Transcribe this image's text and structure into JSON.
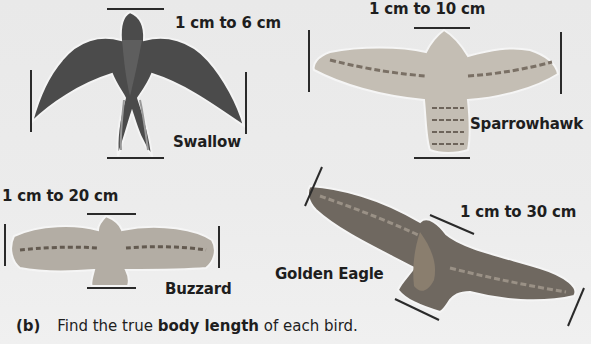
{
  "birds": [
    {
      "name": "Swallow",
      "scale": "1 cm to 6 cm"
    },
    {
      "name": "Sparrowhawk",
      "scale": "1 cm to 10 cm"
    },
    {
      "name": "Buzzard",
      "scale": "1 cm to 20 cm"
    },
    {
      "name": "Golden Eagle",
      "scale": "1 cm to 30 cm"
    }
  ],
  "question": {
    "label": "(b)",
    "text_before": "Find the true ",
    "text_bold": "body length",
    "text_after": " of each bird."
  },
  "colors": {
    "background": "#ebebeb",
    "swallow": "#4a4a4a",
    "sparrowhawk": "#b8b2a8",
    "buzzard": "#a9a39a",
    "eagle": "#6d665e",
    "measure_line": "#2a2a2a"
  }
}
